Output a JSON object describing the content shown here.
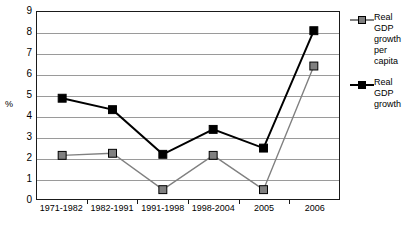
{
  "chart_data": {
    "type": "line",
    "title": "",
    "xlabel": "",
    "ylabel": "%",
    "ylim": [
      0,
      9
    ],
    "yticks": [
      0,
      1,
      2,
      3,
      4,
      5,
      6,
      7,
      8,
      9
    ],
    "grid": true,
    "legend_position": "right",
    "categories": [
      "1971-1982",
      "1982-1991",
      "1991-1998",
      "1998-2004",
      "2005",
      "2006"
    ],
    "series": [
      {
        "name": "Real GDP growth per capita",
        "color": "#808080",
        "marker": "square",
        "values": [
          2.1,
          2.2,
          0.45,
          2.1,
          0.45,
          6.4
        ]
      },
      {
        "name": "Real GDP growth",
        "color": "#000000",
        "marker": "square",
        "values": [
          4.85,
          4.3,
          2.15,
          3.35,
          2.45,
          8.1
        ]
      }
    ]
  },
  "legend": {
    "entries": [
      {
        "lines": [
          "Real",
          "GDP",
          "growth",
          "per",
          "capita"
        ],
        "color": "#808080"
      },
      {
        "lines": [
          "Real",
          "GDP",
          "growth"
        ],
        "color": "#000000"
      }
    ]
  },
  "colors": {
    "axis": "#1a1a1a",
    "grid": "#9a9a9a",
    "series_gray": "#808080",
    "series_black": "#000000",
    "background": "#ffffff"
  }
}
